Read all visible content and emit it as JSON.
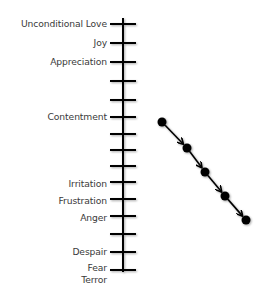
{
  "diagram": {
    "type": "emotional-scale",
    "axis": {
      "x": 123,
      "y_top": 18,
      "y_bottom": 272,
      "tick_half_width": 13,
      "color": "#000000"
    },
    "ticks": [
      {
        "y": 24,
        "label": "Unconditional Love"
      },
      {
        "y": 43,
        "label": "Joy"
      },
      {
        "y": 62,
        "label": "Appreciation"
      },
      {
        "y": 81,
        "label": ""
      },
      {
        "y": 100,
        "label": ""
      },
      {
        "y": 117,
        "label": "Contentment"
      },
      {
        "y": 134,
        "label": ""
      },
      {
        "y": 150,
        "label": ""
      },
      {
        "y": 166,
        "label": ""
      },
      {
        "y": 184,
        "label": "Irritation"
      },
      {
        "y": 201,
        "label": "Frustration"
      },
      {
        "y": 218,
        "label": "Anger"
      },
      {
        "y": 235,
        "label": ""
      },
      {
        "y": 252,
        "label": "Despair"
      },
      {
        "y": 268,
        "label": "Fear"
      },
      {
        "y": 280,
        "label": "Terror"
      }
    ],
    "path": {
      "points": [
        {
          "x": 162,
          "y": 122
        },
        {
          "x": 187,
          "y": 148
        },
        {
          "x": 205,
          "y": 172
        },
        {
          "x": 225,
          "y": 196
        },
        {
          "x": 246,
          "y": 220
        }
      ],
      "dot_radius": 4.5,
      "color": "#000000"
    }
  }
}
